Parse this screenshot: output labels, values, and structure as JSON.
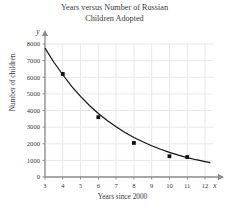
{
  "chart_data": {
    "type": "scatter",
    "title": "Years versus Number of Russian Children Adopted",
    "title_lines": [
      "Years versus Number of Russian",
      "Children Adopted"
    ],
    "xlabel": "Years since 2000",
    "ylabel": "Number of children",
    "x_axis_variable": "x",
    "y_axis_variable": "y",
    "xlim": [
      3,
      12
    ],
    "ylim": [
      0,
      8000
    ],
    "x_ticks": [
      3,
      4,
      5,
      6,
      7,
      8,
      9,
      10,
      11,
      12
    ],
    "x_tick_labels": [
      "3",
      "4",
      "5",
      "6",
      "7",
      "8",
      "9",
      "10",
      "11",
      "12"
    ],
    "y_ticks": [
      0,
      1000,
      2000,
      3000,
      4000,
      5000,
      6000,
      7000,
      8000
    ],
    "y_tick_labels": [
      "0",
      "1000",
      "2000",
      "3000",
      "4000",
      "5000",
      "6000",
      "7000",
      "8000"
    ],
    "grid": true,
    "legend": false,
    "series": [
      {
        "name": "Children adopted",
        "type": "scatter",
        "marker": "square",
        "color": "#111111",
        "points": [
          {
            "x": 4,
            "y": 6200
          },
          {
            "x": 6,
            "y": 3600
          },
          {
            "x": 8,
            "y": 2050
          },
          {
            "x": 10,
            "y": 1250
          },
          {
            "x": 11,
            "y": 1200
          }
        ]
      },
      {
        "name": "Exponential fit curve",
        "type": "line",
        "color": "#111111",
        "curve": [
          {
            "x": 3.0,
            "y": 7750
          },
          {
            "x": 3.5,
            "y": 6900
          },
          {
            "x": 4.0,
            "y": 6150
          },
          {
            "x": 4.5,
            "y": 5450
          },
          {
            "x": 5.0,
            "y": 4850
          },
          {
            "x": 5.5,
            "y": 4300
          },
          {
            "x": 6.0,
            "y": 3820
          },
          {
            "x": 6.5,
            "y": 3400
          },
          {
            "x": 7.0,
            "y": 3020
          },
          {
            "x": 7.5,
            "y": 2680
          },
          {
            "x": 8.0,
            "y": 2380
          },
          {
            "x": 8.5,
            "y": 2120
          },
          {
            "x": 9.0,
            "y": 1880
          },
          {
            "x": 9.5,
            "y": 1670
          },
          {
            "x": 10.0,
            "y": 1480
          },
          {
            "x": 10.5,
            "y": 1320
          },
          {
            "x": 11.0,
            "y": 1170
          },
          {
            "x": 11.5,
            "y": 1040
          },
          {
            "x": 12.0,
            "y": 930
          },
          {
            "x": 12.3,
            "y": 870
          }
        ]
      }
    ],
    "colors": {
      "background": "#ffffff",
      "grid": "#e8e8e8",
      "axis": "#8c8c8c",
      "text": "#3a3a3a",
      "data": "#111111"
    }
  }
}
